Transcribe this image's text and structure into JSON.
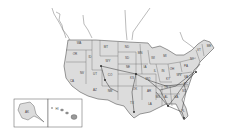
{
  "map": {
    "title": "United States map with state abbreviations and connecting routes",
    "colors": {
      "land": "#dcdcdc",
      "border": "#555555",
      "route": "#333333",
      "background": "#ffffff"
    },
    "states": [
      {
        "abbr": "WA",
        "x": 79,
        "y": 44
      },
      {
        "abbr": "OR",
        "x": 75,
        "y": 55
      },
      {
        "abbr": "ID",
        "x": 90,
        "y": 58
      },
      {
        "abbr": "MT",
        "x": 106,
        "y": 48
      },
      {
        "abbr": "ND",
        "x": 127,
        "y": 48
      },
      {
        "abbr": "SD",
        "x": 127,
        "y": 59
      },
      {
        "abbr": "MN",
        "x": 140,
        "y": 54
      },
      {
        "abbr": "WI",
        "x": 153,
        "y": 59
      },
      {
        "abbr": "MI",
        "x": 165,
        "y": 57
      },
      {
        "abbr": "WY",
        "x": 108,
        "y": 62
      },
      {
        "abbr": "NV",
        "x": 82,
        "y": 74
      },
      {
        "abbr": "CA",
        "x": 72,
        "y": 82
      },
      {
        "abbr": "UT",
        "x": 95,
        "y": 75
      },
      {
        "abbr": "CO",
        "x": 110,
        "y": 76
      },
      {
        "abbr": "NE",
        "x": 128,
        "y": 68
      },
      {
        "abbr": "KS",
        "x": 132,
        "y": 79
      },
      {
        "abbr": "IA",
        "x": 145,
        "y": 68
      },
      {
        "abbr": "IL",
        "x": 155,
        "y": 72
      },
      {
        "abbr": "IN",
        "x": 163,
        "y": 72
      },
      {
        "abbr": "OH",
        "x": 172,
        "y": 70
      },
      {
        "abbr": "AZ",
        "x": 95,
        "y": 91
      },
      {
        "abbr": "NM",
        "x": 110,
        "y": 92
      },
      {
        "abbr": "OK",
        "x": 135,
        "y": 90
      },
      {
        "abbr": "TX",
        "x": 132,
        "y": 104
      },
      {
        "abbr": "MO",
        "x": 148,
        "y": 80
      },
      {
        "abbr": "AR",
        "x": 149,
        "y": 92
      },
      {
        "abbr": "LA",
        "x": 150,
        "y": 105
      },
      {
        "abbr": "MS",
        "x": 158,
        "y": 98
      },
      {
        "abbr": "AL",
        "x": 166,
        "y": 98
      },
      {
        "abbr": "GA",
        "x": 176,
        "y": 98
      },
      {
        "abbr": "FL",
        "x": 183,
        "y": 112
      },
      {
        "abbr": "SC",
        "x": 184,
        "y": 92
      },
      {
        "abbr": "NC",
        "x": 186,
        "y": 85
      },
      {
        "abbr": "TN",
        "x": 166,
        "y": 88
      },
      {
        "abbr": "KY",
        "x": 168,
        "y": 80
      },
      {
        "abbr": "VA",
        "x": 186,
        "y": 78
      },
      {
        "abbr": "WV",
        "x": 179,
        "y": 76
      },
      {
        "abbr": "PA",
        "x": 186,
        "y": 67
      },
      {
        "abbr": "NY",
        "x": 192,
        "y": 60
      },
      {
        "abbr": "VT",
        "x": 199,
        "y": 51
      },
      {
        "abbr": "ME",
        "x": 209,
        "y": 47
      },
      {
        "abbr": "AK",
        "x": 27,
        "y": 113
      },
      {
        "abbr": "HI",
        "x": 57,
        "y": 110
      }
    ],
    "insets": [
      {
        "name": "Alaska",
        "x": 14,
        "y": 99,
        "w": 34,
        "h": 28
      },
      {
        "name": "Hawaii",
        "x": 48,
        "y": 99,
        "w": 34,
        "h": 28
      }
    ]
  }
}
